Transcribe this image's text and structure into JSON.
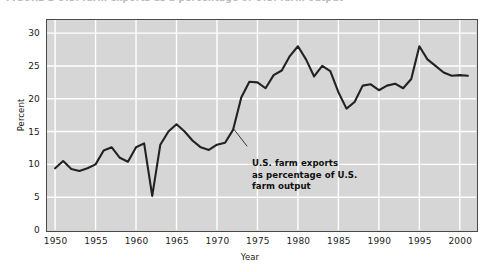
{
  "caption": {
    "text": "FIGURE 2  U.S. farm exports as a percentage of U.S. farm output"
  },
  "chart_data": {
    "type": "line",
    "title": "",
    "subtitle": "",
    "xlabel": "Year",
    "ylabel": "Percent",
    "xlim": [
      1949,
      2002
    ],
    "ylim": [
      0,
      32
    ],
    "grid": true,
    "legend": null,
    "series_name": "U.S. farm exports as percentage of U.S. farm output",
    "line_color": "#222222",
    "plot_background": "#d6d6d6",
    "gridline_color": "#ffffff",
    "annotations": [
      {
        "lines": [
          "U.S. farm exports",
          "as percentage of U.S.",
          "farm output"
        ],
        "points_to_year": 1972,
        "points_to_value": 15.5
      }
    ],
    "xticks": [
      1950,
      1955,
      1960,
      1965,
      1970,
      1975,
      1980,
      1985,
      1990,
      1995,
      2000
    ],
    "xtick_labels": [
      "1950",
      "1955",
      "1960",
      "1965",
      "1970",
      "1975",
      "1980",
      "1985",
      "1990",
      "1995",
      "2000"
    ],
    "yticks": [
      0,
      5,
      10,
      15,
      20,
      25,
      30
    ],
    "ytick_labels": [
      "0",
      "5",
      "10",
      "15",
      "20",
      "25",
      "30"
    ],
    "x": [
      1950,
      1951,
      1952,
      1953,
      1954,
      1955,
      1956,
      1957,
      1958,
      1959,
      1960,
      1961,
      1962,
      1963,
      1964,
      1965,
      1966,
      1967,
      1968,
      1969,
      1970,
      1971,
      1972,
      1973,
      1974,
      1975,
      1976,
      1977,
      1978,
      1979,
      1980,
      1981,
      1982,
      1983,
      1984,
      1985,
      1986,
      1987,
      1988,
      1989,
      1990,
      1991,
      1992,
      1993,
      1994,
      1995,
      1996,
      1997,
      1998,
      1999,
      2000,
      2001
    ],
    "values": [
      9.4,
      10.5,
      9.3,
      9.0,
      9.4,
      10.0,
      12.1,
      12.6,
      11.0,
      10.4,
      12.6,
      13.2,
      5.2,
      13.0,
      15.0,
      16.1,
      15.0,
      13.6,
      12.6,
      12.2,
      13.0,
      13.3,
      15.3,
      20.2,
      22.6,
      22.5,
      21.6,
      23.6,
      24.3,
      26.5,
      28.0,
      26.0,
      23.4,
      25.0,
      24.2,
      21.0,
      18.5,
      19.5,
      22.0,
      22.2,
      21.3,
      22.0,
      22.3,
      21.6,
      23.0,
      28.0,
      26.0,
      25.0,
      24.0,
      23.5,
      23.6,
      23.5
    ]
  }
}
